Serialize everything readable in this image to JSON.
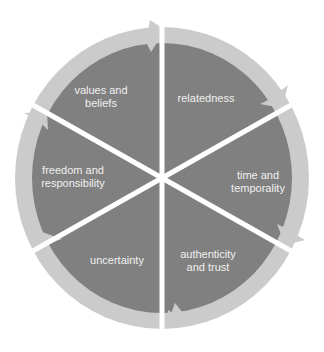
{
  "diagram": {
    "type": "cycle",
    "colors": {
      "segment_fill": "#808080",
      "ring_fill": "#cbcbcb",
      "divider": "#ffffff",
      "label_text": "#f0f0f0"
    },
    "segments": [
      {
        "id": "values",
        "line1": "values and",
        "line2": "beliefs",
        "x": 101,
        "y": 97
      },
      {
        "id": "relatedness",
        "line1": "relatedness",
        "line2": "",
        "x": 206,
        "y": 98
      },
      {
        "id": "time",
        "line1": "time and",
        "line2": "temporality",
        "x": 256,
        "y": 176
      },
      {
        "id": "authenticity",
        "line1": "authenticity",
        "line2": "and trust",
        "x": 208,
        "y": 255
      },
      {
        "id": "uncertainty",
        "line1": "uncertainty",
        "line2": "",
        "x": 117,
        "y": 260
      },
      {
        "id": "freedom",
        "line1": "freedom and",
        "line2": "responsibility",
        "x": 73,
        "y": 177
      }
    ]
  }
}
